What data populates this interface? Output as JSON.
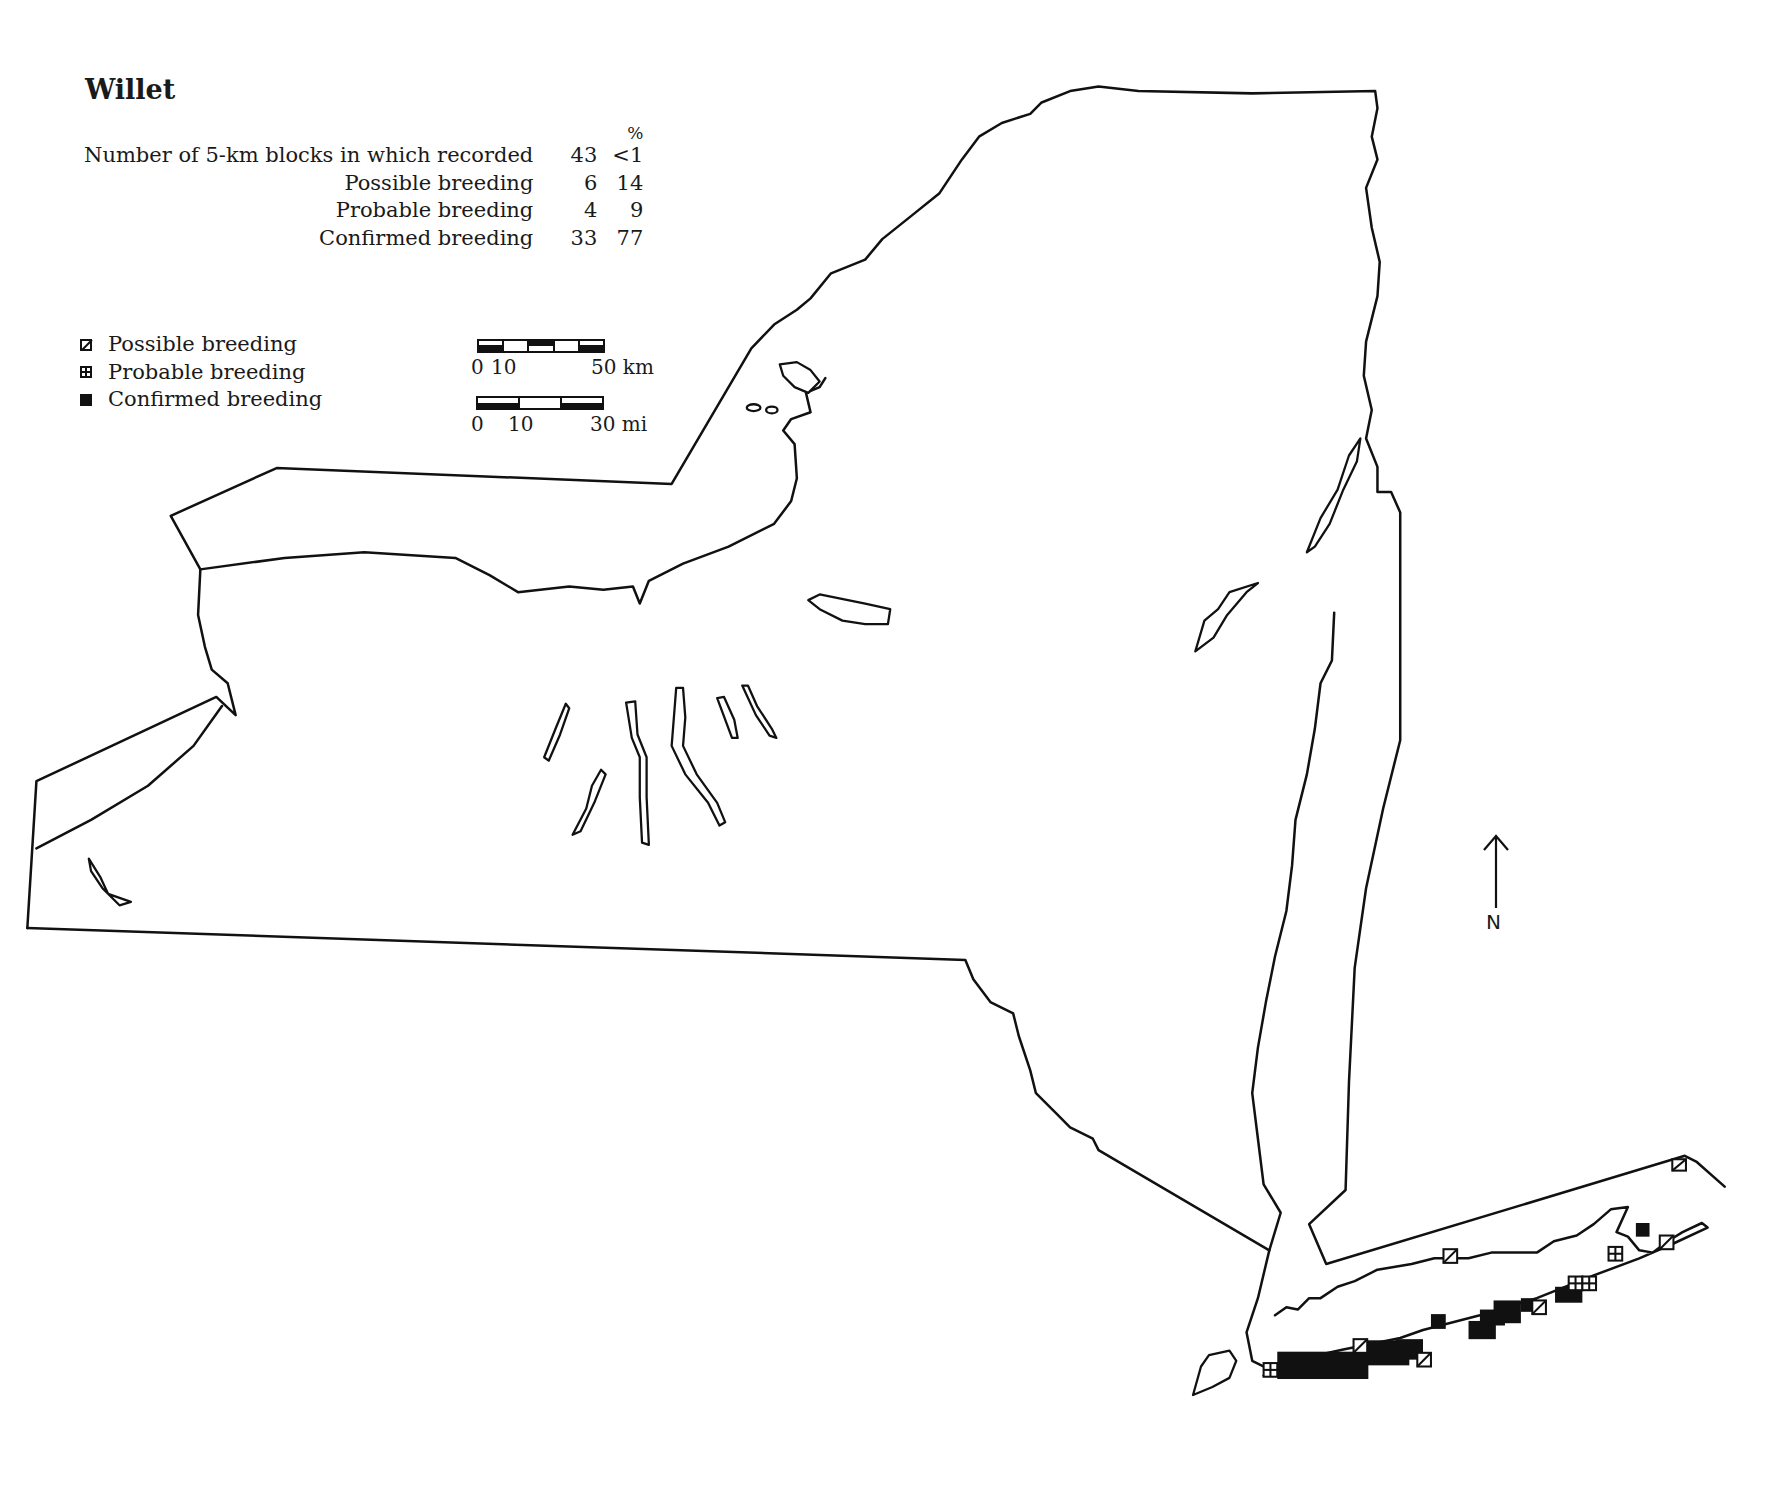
{
  "title": "Willet",
  "stats": {
    "percent_header": "%",
    "rows": [
      {
        "label": "Number of 5-km blocks in which recorded",
        "count": "43",
        "percent": "<1"
      },
      {
        "label": "Possible breeding",
        "count": "6",
        "percent": "14"
      },
      {
        "label": "Probable breeding",
        "count": "4",
        "percent": "9"
      },
      {
        "label": "Confirmed breeding",
        "count": "33",
        "percent": "77"
      }
    ]
  },
  "legend": {
    "items": [
      {
        "symbol": "square-slash-icon",
        "label": "Possible breeding"
      },
      {
        "symbol": "square-cross-icon",
        "label": "Probable breeding"
      },
      {
        "symbol": "filled-square-icon",
        "label": "Confirmed breeding"
      }
    ]
  },
  "scale_bars": {
    "km": {
      "labels": [
        "0",
        "10",
        "50 km"
      ],
      "segments": 5
    },
    "mi": {
      "labels": [
        "0",
        "10",
        "30 mi"
      ],
      "segments": 3
    }
  },
  "north_arrow": {
    "label": "N"
  },
  "map": {
    "region": "New York State",
    "species": "Willet",
    "colors": {
      "outline": "#111111",
      "background": "#ffffff",
      "confirmed": "#111111"
    },
    "records": {
      "confirmed_area": "South shore of Long Island (barrier beaches), Queens/Nassau east to Suffolk",
      "possible_locations": [
        "North shore Long Island",
        "South shore barrier",
        "Fishers Island area",
        "Orient Point area"
      ],
      "probable_locations": [
        "Western Nassau",
        "North Fork",
        "Peconic area"
      ]
    }
  }
}
